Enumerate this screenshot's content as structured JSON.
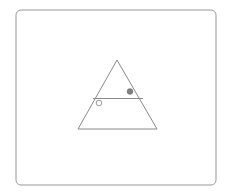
{
  "canvas": {
    "width": 234,
    "height": 194,
    "background_color": "#ffffff"
  },
  "frame": {
    "label": "outer-frame",
    "x": 16,
    "y": 10,
    "width": 200,
    "height": 175,
    "corner_radius": 5,
    "stroke_color": "#999999",
    "stroke_width": 1,
    "fill_color": "#ffffff"
  },
  "triangle": {
    "label": "triangle",
    "apex_x": 117,
    "apex_y": 60,
    "base_left_x": 78,
    "base_left_y": 129,
    "base_right_x": 157,
    "base_right_y": 129,
    "points": "117,60 157,129 78,129",
    "stroke_color": "#8a8a8a",
    "stroke_width": 1,
    "fill_color": "none"
  },
  "crossbar": {
    "label": "horizontal-segment",
    "x1": 93,
    "y1": 98.5,
    "x2": 143,
    "y2": 98.5,
    "stroke_color": "#8a8a8a",
    "stroke_width": 1.2
  },
  "markers": [
    {
      "id": "filled-dot",
      "label": "filled-circle-marker",
      "cx": 130,
      "cy": 91.5,
      "r": 2.8,
      "style": "filled",
      "fill_color": "#808080",
      "stroke_color": "#6e6e6e",
      "stroke_width": 0.8
    },
    {
      "id": "open-dot",
      "label": "open-circle-marker",
      "cx": 99,
      "cy": 103,
      "r": 2.8,
      "style": "open",
      "fill_color": "#ffffff",
      "stroke_color": "#9a9a9a",
      "stroke_width": 1
    }
  ]
}
